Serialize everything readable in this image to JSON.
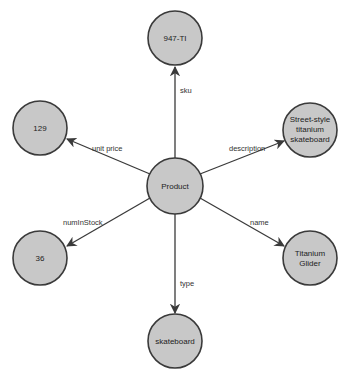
{
  "diagram": {
    "type": "radial-graph",
    "colors": {
      "node_fill": "#c8c8c8",
      "node_stroke": "#3a3a3a",
      "edge": "#3a3a3a",
      "text": "#222222"
    },
    "center": {
      "id": "product",
      "label": "Product"
    },
    "nodes": {
      "sku": {
        "lines": [
          "947-TI"
        ]
      },
      "unit_price": {
        "lines": [
          "129"
        ]
      },
      "description": {
        "lines": [
          "Street-style",
          "titanium",
          "skateboard"
        ]
      },
      "num_in_stock": {
        "lines": [
          "36"
        ]
      },
      "name": {
        "lines": [
          "Titanium",
          "Glider"
        ]
      },
      "type": {
        "lines": [
          "skateboard"
        ]
      }
    },
    "edges": {
      "sku": "sku",
      "unit_price": "unit price",
      "description": "description",
      "num_in_stock": "numInStock",
      "name": "name",
      "type": "type"
    }
  }
}
